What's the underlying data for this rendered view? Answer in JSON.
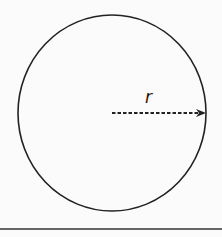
{
  "diagram": {
    "title": "",
    "shape": "circle",
    "radius_label": "r",
    "arrow_style": "dashed",
    "colors": {
      "stroke": "#222222",
      "background": "#fbfbfb"
    }
  }
}
